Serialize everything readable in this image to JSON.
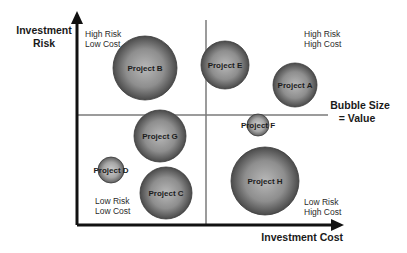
{
  "chart_data": {
    "type": "bubble",
    "title": "",
    "xlabel": "Investment Cost",
    "ylabel": "Investment Risk",
    "legend_note": [
      "Bubble Size",
      "= Value"
    ],
    "grid": false,
    "quadrants": [
      {
        "id": "top-left",
        "lines": [
          "High Risk",
          "Low Cost"
        ]
      },
      {
        "id": "top-right",
        "lines": [
          "High Risk",
          "High Cost"
        ]
      },
      {
        "id": "bottom-left",
        "lines": [
          "Low Risk",
          "Low Cost"
        ]
      },
      {
        "id": "bottom-right",
        "lines": [
          "Low Risk",
          "High Cost"
        ]
      }
    ],
    "series": [
      {
        "name": "Project A",
        "cx": 295,
        "cy": 85,
        "r": 22
      },
      {
        "name": "Project B",
        "cx": 145,
        "cy": 68,
        "r": 32
      },
      {
        "name": "Project C",
        "cx": 166,
        "cy": 193,
        "r": 26
      },
      {
        "name": "Project D",
        "cx": 111,
        "cy": 170,
        "r": 13
      },
      {
        "name": "Project E",
        "cx": 225,
        "cy": 65,
        "r": 24
      },
      {
        "name": "Project F",
        "cx": 258,
        "cy": 125,
        "r": 11
      },
      {
        "name": "Project G",
        "cx": 160,
        "cy": 136,
        "r": 26
      },
      {
        "name": "Project H",
        "cx": 265,
        "cy": 181,
        "r": 34
      }
    ]
  },
  "labels": {
    "y_axis_line1": "Investment",
    "y_axis_line2": "Risk",
    "x_axis": "Investment Cost",
    "legend_line1": "Bubble Size",
    "legend_line2": "= Value",
    "q_tl_1": "High Risk",
    "q_tl_2": "Low Cost",
    "q_tr_1": "High Risk",
    "q_tr_2": "High Cost",
    "q_bl_1": "Low Risk",
    "q_bl_2": "Low Cost",
    "q_br_1": "Low Risk",
    "q_br_2": "High Cost"
  },
  "colors": {
    "axis": "#111111",
    "divider": "#777777",
    "bubble_light": "#c4c4c4",
    "bubble_dark": "#4a4a4a"
  }
}
